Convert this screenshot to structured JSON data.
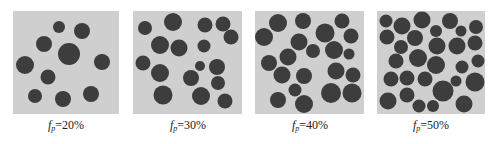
{
  "figure": {
    "particle_color": "#3d3d3d",
    "background_color": "#cfcfcf",
    "panels": [
      {
        "label": {
          "var": "f",
          "sub": "p",
          "value": "=20%"
        },
        "box": [
          13,
          11,
          106,
          103
        ],
        "circles": [
          [
            59,
            27,
            6
          ],
          [
            82,
            31,
            8
          ],
          [
            44,
            44,
            8
          ],
          [
            69,
            54,
            11
          ],
          [
            102,
            62,
            8
          ],
          [
            25,
            65,
            9
          ],
          [
            48,
            77,
            7.5
          ],
          [
            35,
            96,
            7
          ],
          [
            63,
            99,
            8
          ],
          [
            91,
            94,
            8
          ]
        ]
      },
      {
        "label": {
          "var": "f",
          "sub": "p",
          "value": "=30%"
        },
        "box": [
          133,
          11,
          109,
          103
        ],
        "circles": [
          [
            145,
            28,
            7
          ],
          [
            173,
            22,
            9
          ],
          [
            205,
            25,
            7.5
          ],
          [
            223,
            24,
            7.5
          ],
          [
            231,
            37,
            7.5
          ],
          [
            160,
            45,
            9
          ],
          [
            179,
            48,
            8.5
          ],
          [
            204,
            46,
            6.5
          ],
          [
            143,
            63,
            7.5
          ],
          [
            160,
            73,
            9
          ],
          [
            200,
            66,
            5
          ],
          [
            217,
            67,
            8
          ],
          [
            191,
            78,
            8
          ],
          [
            218,
            83,
            7
          ],
          [
            163,
            95,
            9.5
          ],
          [
            201,
            96,
            9
          ],
          [
            225,
            101,
            7.5
          ]
        ]
      },
      {
        "label": {
          "var": "f",
          "sub": "p",
          "value": "=40%"
        },
        "box": [
          255,
          11,
          109,
          103
        ],
        "circles": [
          [
            278,
            23,
            9
          ],
          [
            303,
            21,
            8
          ],
          [
            342,
            21,
            7.5
          ],
          [
            264,
            37,
            9
          ],
          [
            325,
            33,
            9.5
          ],
          [
            351,
            36,
            7.5
          ],
          [
            299,
            42,
            8.5
          ],
          [
            313,
            51,
            7
          ],
          [
            334,
            50,
            9
          ],
          [
            349,
            54,
            5.5
          ],
          [
            269,
            63,
            8
          ],
          [
            288,
            57,
            8.5
          ],
          [
            282,
            75,
            8.5
          ],
          [
            304,
            76,
            8
          ],
          [
            336,
            71,
            8.5
          ],
          [
            353,
            75,
            7.5
          ],
          [
            295,
            90,
            6.5
          ],
          [
            331,
            93,
            10
          ],
          [
            352,
            93,
            9.5
          ],
          [
            278,
            100,
            8
          ],
          [
            304,
            104,
            9
          ]
        ]
      },
      {
        "label": {
          "var": "f",
          "sub": "p",
          "value": "=50%"
        },
        "box": [
          377,
          11,
          108,
          103
        ],
        "circles": [
          [
            386,
            21,
            6.5
          ],
          [
            402,
            26,
            8.5
          ],
          [
            422,
            20,
            8.5
          ],
          [
            436,
            31,
            6
          ],
          [
            450,
            21,
            8
          ],
          [
            461,
            31,
            5.5
          ],
          [
            476,
            27,
            7
          ],
          [
            387,
            37,
            7.5
          ],
          [
            401,
            47,
            7
          ],
          [
            415,
            38,
            8
          ],
          [
            437,
            46,
            8.5
          ],
          [
            457,
            46,
            8.5
          ],
          [
            475,
            43,
            7.5
          ],
          [
            396,
            61,
            7.5
          ],
          [
            418,
            58,
            9
          ],
          [
            436,
            65,
            9
          ],
          [
            462,
            67,
            6.5
          ],
          [
            478,
            61,
            6.5
          ],
          [
            391,
            79,
            7.5
          ],
          [
            407,
            78,
            7.5
          ],
          [
            425,
            79,
            7.5
          ],
          [
            456,
            81,
            5.5
          ],
          [
            475,
            82,
            9.5
          ],
          [
            443,
            91,
            10.5
          ],
          [
            407,
            95,
            7.5
          ],
          [
            388,
            101,
            8.5
          ],
          [
            419,
            106,
            6.5
          ],
          [
            433,
            106,
            6
          ],
          [
            464,
            104,
            8.5
          ]
        ]
      }
    ],
    "label_centers_x": [
      66,
      188,
      310,
      431
    ]
  }
}
